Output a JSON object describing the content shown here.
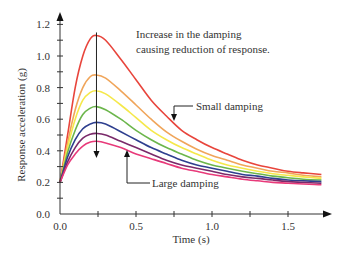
{
  "chart_data": {
    "type": "line",
    "title": "",
    "xlabel": "Time (s)",
    "ylabel": "Response acceleration (g)",
    "xlim": [
      0.0,
      1.75
    ],
    "ylim": [
      0.0,
      1.25
    ],
    "x_ticks": [
      0.0,
      0.5,
      1.0,
      1.5
    ],
    "x_tick_labels": [
      "0.0",
      "0.5",
      "1.0",
      "1.5"
    ],
    "x_minor_ticks": [
      0.25,
      0.75,
      1.25
    ],
    "y_ticks": [
      0.0,
      0.2,
      0.4,
      0.6,
      0.8,
      1.0,
      1.2
    ],
    "y_tick_labels": [
      "0.0",
      "0.2",
      "0.4",
      "0.6",
      "0.8",
      "1.0",
      "1.2"
    ],
    "y_minor_ticks": [
      0.1,
      0.3,
      0.5,
      0.7,
      0.9,
      1.1
    ],
    "grid": false,
    "legend": "none",
    "peak_time": 0.24,
    "x": [
      0.0,
      0.05,
      0.1,
      0.15,
      0.2,
      0.24,
      0.3,
      0.4,
      0.5,
      0.6,
      0.7,
      0.8,
      0.9,
      1.0,
      1.1,
      1.2,
      1.3,
      1.4,
      1.5,
      1.6,
      1.72
    ],
    "series": [
      {
        "name": "Small damping",
        "color": "#e8453c",
        "values": [
          0.2,
          0.5,
          0.8,
          1.0,
          1.11,
          1.13,
          1.1,
          0.98,
          0.85,
          0.72,
          0.62,
          0.53,
          0.47,
          0.42,
          0.38,
          0.34,
          0.31,
          0.29,
          0.27,
          0.26,
          0.25
        ]
      },
      {
        "name": "damping level 2",
        "color": "#f0a55a",
        "values": [
          0.2,
          0.45,
          0.66,
          0.8,
          0.87,
          0.88,
          0.86,
          0.78,
          0.69,
          0.6,
          0.52,
          0.46,
          0.41,
          0.37,
          0.34,
          0.31,
          0.29,
          0.27,
          0.26,
          0.245,
          0.235
        ]
      },
      {
        "name": "damping level 3",
        "color": "#f5e84a",
        "values": [
          0.2,
          0.42,
          0.6,
          0.72,
          0.77,
          0.78,
          0.76,
          0.69,
          0.61,
          0.53,
          0.47,
          0.42,
          0.38,
          0.34,
          0.31,
          0.29,
          0.27,
          0.255,
          0.245,
          0.235,
          0.225
        ]
      },
      {
        "name": "damping level 4",
        "color": "#6cb64c",
        "values": [
          0.2,
          0.39,
          0.53,
          0.63,
          0.67,
          0.68,
          0.66,
          0.6,
          0.53,
          0.47,
          0.42,
          0.38,
          0.34,
          0.31,
          0.29,
          0.27,
          0.255,
          0.24,
          0.23,
          0.22,
          0.215
        ]
      },
      {
        "name": "damping level 5",
        "color": "#2e3f8f",
        "values": [
          0.2,
          0.36,
          0.47,
          0.54,
          0.57,
          0.58,
          0.57,
          0.52,
          0.47,
          0.42,
          0.38,
          0.34,
          0.31,
          0.29,
          0.27,
          0.25,
          0.24,
          0.225,
          0.215,
          0.21,
          0.205
        ]
      },
      {
        "name": "damping level 6",
        "color": "#7a2a6a",
        "values": [
          0.2,
          0.33,
          0.42,
          0.48,
          0.505,
          0.51,
          0.5,
          0.46,
          0.42,
          0.38,
          0.34,
          0.31,
          0.29,
          0.27,
          0.25,
          0.235,
          0.225,
          0.215,
          0.205,
          0.2,
          0.195
        ]
      },
      {
        "name": "Large damping",
        "color": "#e83a7a",
        "values": [
          0.2,
          0.31,
          0.38,
          0.43,
          0.455,
          0.46,
          0.45,
          0.42,
          0.38,
          0.35,
          0.32,
          0.29,
          0.27,
          0.25,
          0.235,
          0.22,
          0.21,
          0.2,
          0.195,
          0.19,
          0.185
        ]
      }
    ],
    "annotations": [
      {
        "text_line1": "Increase in the damping",
        "text_line2": "causing reduction of response."
      },
      {
        "text": "Small damping",
        "points_to_series": "Small damping"
      },
      {
        "text": "Large damping",
        "points_to_series": "Large damping"
      }
    ]
  }
}
